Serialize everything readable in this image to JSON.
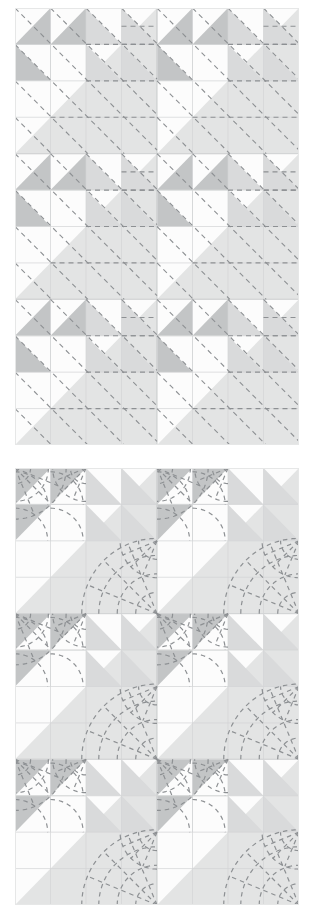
{
  "figure": {
    "kind": "quilt-pattern-diagram",
    "panel_count": 2,
    "canvas": {
      "width": 314,
      "height": 914,
      "background": "#ffffff"
    },
    "colors": {
      "background_white": "#ffffff",
      "patch_white": "#fcfcfc",
      "patch_light_gray": "#e3e4e4",
      "patch_mid_gray": "#c3c5c6",
      "patch_shade_gray": "#d9dadb",
      "seam_line": "#d2d4d5",
      "panel_border": "#e6e7e7",
      "quilting_stitch": "#8d9093"
    },
    "block_layout": {
      "blocks_across": 2,
      "blocks_down": 3,
      "units_per_block": 4,
      "unit_type": "half-square-triangle",
      "pinwheel_quadrant": "upper-left 2x2"
    },
    "panels": [
      {
        "id": "panel-top",
        "name": "straight-line-quilting-diagram",
        "quilting_style": "straight line",
        "quilting_motifs": [
          "diagonal dashed lines",
          "horizontal dashed lines"
        ],
        "x": 15,
        "y": 8,
        "width": 284,
        "height": 437,
        "block_w": 142,
        "block_h": 145.6,
        "triangle_orientation": "pinwheel",
        "stitch_dash": "5 4",
        "stitch_width": 1.1
      },
      {
        "id": "panel-bottom",
        "name": "fan-arc-quilting-diagram",
        "quilting_style": "fan / clamshell arcs",
        "quilting_motifs": [
          "concentric quarter-circle arcs",
          "radiating fan spokes"
        ],
        "x": 15,
        "y": 468,
        "width": 284,
        "height": 437,
        "block_w": 142,
        "block_h": 145.6,
        "triangle_orientation": "uniform diagonal",
        "stitch_dash": "4.5 4",
        "stitch_width": 1.2
      }
    ]
  },
  "chart_data": {
    "type": "diagram",
    "title": "",
    "subtitle": "",
    "panels": [
      {
        "label": "straight line quilting",
        "rows": 3,
        "cols": 2,
        "hst_units_per_block": 4,
        "quilting": "diagonal and horizontal dashed lines"
      },
      {
        "label": "fan arc quilting",
        "rows": 3,
        "cols": 2,
        "hst_units_per_block": 4,
        "quilting": "concentric arcs with fan spokes from block corners"
      }
    ]
  }
}
